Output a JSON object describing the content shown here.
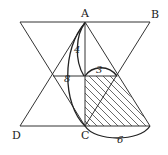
{
  "diagram": {
    "type": "geometry-hourglass-triangles",
    "points": {
      "A": {
        "label": "A",
        "x": 85,
        "y": 22
      },
      "B": {
        "label": "B",
        "x": 150,
        "y": 22
      },
      "C": {
        "label": "C",
        "x": 85,
        "y": 126
      },
      "D": {
        "label": "D",
        "x": 20,
        "y": 126
      }
    },
    "labels": {
      "A": "A",
      "B": "B",
      "C": "C",
      "D": "D"
    },
    "measurements": {
      "upper_height": "4",
      "full_height": "8",
      "mid_width": "3",
      "base_width": "6"
    },
    "shaded_region": {
      "shape": "trapezoid",
      "vertices": [
        [
          85,
          76
        ],
        [
          117,
          76
        ],
        [
          150,
          126
        ],
        [
          85,
          126
        ]
      ],
      "pattern": "diagonal-hatch"
    },
    "colors": {
      "line": "#333333",
      "text": "#222222",
      "background": "#ffffff"
    }
  }
}
